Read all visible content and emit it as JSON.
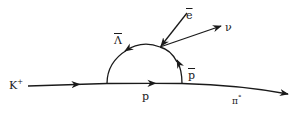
{
  "diagram": {
    "type": "feynman-diagram",
    "stroke_color": "#1a1a1a",
    "background": "#ffffff",
    "particles": {
      "kaon": {
        "symbol": "K",
        "superscript": "+"
      },
      "proton": {
        "symbol": "p"
      },
      "antiproton": {
        "symbol": "p",
        "overline": true
      },
      "antilambda": {
        "symbol": "Λ",
        "overline": true
      },
      "positron": {
        "symbol": "e",
        "overline": true
      },
      "neutrino": {
        "symbol": "ν"
      },
      "pion": {
        "symbol": "π",
        "superscript": "°"
      }
    },
    "lines": [
      {
        "from": "K+",
        "to": "vertex-1",
        "particle": "K+"
      },
      {
        "from": "vertex-1",
        "to": "vertex-2",
        "particle": "p"
      },
      {
        "from": "vertex-2",
        "to": "out",
        "particle": "π°"
      },
      {
        "from": "vertex-2",
        "to": "vertex-3",
        "particle": "p̄"
      },
      {
        "from": "vertex-3",
        "to": "vertex-1",
        "particle": "Λ̄"
      },
      {
        "from": "in",
        "to": "vertex-3",
        "particle": "ē"
      },
      {
        "from": "vertex-3",
        "to": "out",
        "particle": "ν"
      }
    ]
  }
}
